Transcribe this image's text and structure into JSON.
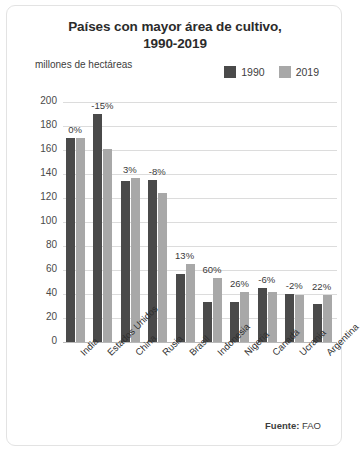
{
  "card": {
    "title": "Países con mayor área de cultivo,\n1990-2019",
    "title_line1": "Países con mayor área de cultivo,",
    "title_line2": "1990-2019",
    "axis_caption": "millones de hectáreas",
    "source_prefix": "Fuente:",
    "source_value": "FAO"
  },
  "colors": {
    "series_1990": "#4a4a4a",
    "series_2019": "#a8a8a8",
    "grid": "#dcdcdc",
    "axis": "#b9b9b9",
    "text": "#3d3d3d",
    "card_border": "#e3e3e3"
  },
  "chart_data": {
    "type": "bar",
    "title": "Países con mayor área de cultivo, 1990-2019",
    "xlabel": "",
    "ylabel": "millones de hectáreas",
    "ylim": [
      0,
      200
    ],
    "yticks": [
      200,
      180,
      160,
      140,
      120,
      100,
      80,
      60,
      40,
      20,
      0
    ],
    "grid": true,
    "legend_position": "top-right",
    "categories": [
      "India",
      "Estados Unidos",
      "China",
      "Rusia",
      "Brasil",
      "Indonesia",
      "Nigeria",
      "Canadá",
      "Ucrania",
      "Argentina"
    ],
    "series": [
      {
        "name": "1990",
        "color": "#4a4a4a",
        "values": [
          170,
          190,
          134,
          135,
          57,
          33,
          33,
          45,
          40,
          32
        ]
      },
      {
        "name": "2019",
        "color": "#a8a8a8",
        "values": [
          170,
          161,
          137,
          124,
          65,
          53,
          42,
          42,
          39,
          39
        ]
      }
    ],
    "annotations": [
      "0%",
      "-15%",
      "3%",
      "-8%",
      "13%",
      "60%",
      "26%",
      "-6%",
      "-2%",
      "22%"
    ]
  }
}
